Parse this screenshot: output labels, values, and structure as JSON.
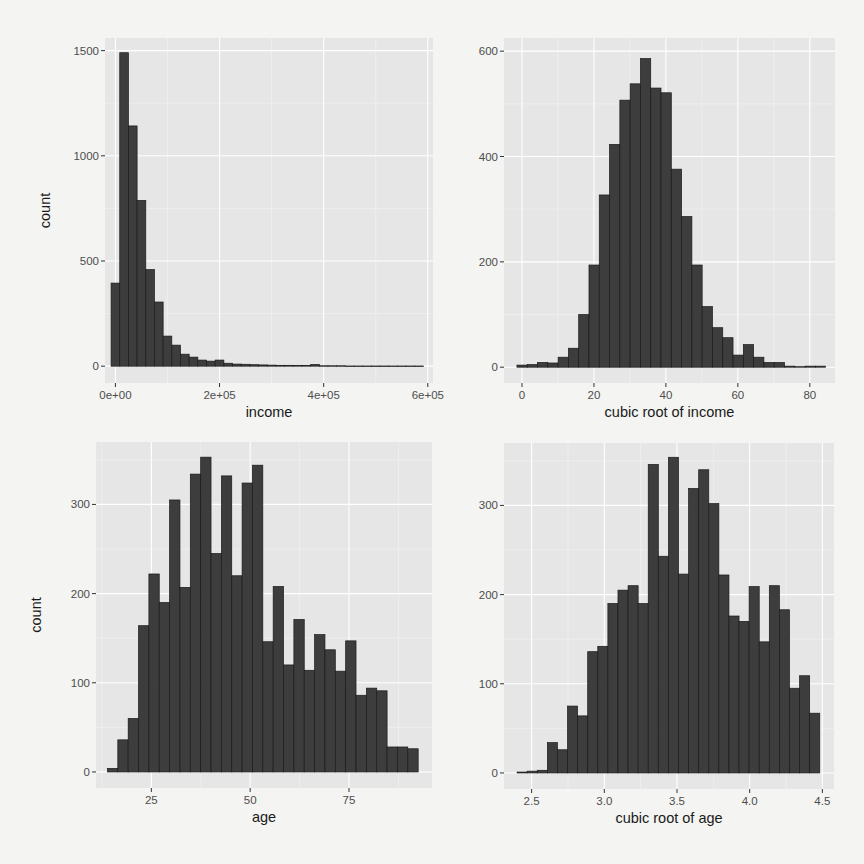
{
  "chart_data": [
    {
      "id": "income",
      "type": "bar",
      "subtype": "histogram",
      "title": "",
      "xlabel": "income",
      "ylabel": "count",
      "xlim": [
        -20000,
        610000
      ],
      "ylim": [
        -80,
        1560
      ],
      "x_ticks": [
        0,
        200000,
        400000,
        600000
      ],
      "x_tick_labels": [
        "0e+00",
        "2e+05",
        "4e+05",
        "6e+05"
      ],
      "y_ticks": [
        0,
        500,
        1000,
        1500
      ],
      "y_tick_labels": [
        "0",
        "500",
        "1000",
        "1500"
      ],
      "bin_start": -8333,
      "bin_width": 16667,
      "values": [
        395,
        1490,
        1142,
        788,
        459,
        305,
        143,
        100,
        57,
        43,
        29,
        24,
        29,
        14,
        10,
        9,
        7,
        6,
        5,
        4,
        4,
        3,
        3,
        8,
        2,
        2,
        2,
        1,
        1,
        1,
        1,
        1,
        1,
        1,
        1,
        1
      ],
      "grid": true
    },
    {
      "id": "cubic-root-income",
      "type": "bar",
      "subtype": "histogram",
      "title": "",
      "xlabel": "cubic root of income",
      "ylabel": "",
      "xlim": [
        -5,
        87
      ],
      "ylim": [
        -30,
        625
      ],
      "x_ticks": [
        0,
        20,
        40,
        60,
        80
      ],
      "x_tick_labels": [
        "0",
        "20",
        "40",
        "60",
        "80"
      ],
      "y_ticks": [
        0,
        200,
        400,
        600
      ],
      "y_tick_labels": [
        "0",
        "200",
        "400",
        "600"
      ],
      "bin_start": -1.4,
      "bin_width": 2.86,
      "values": [
        4,
        5,
        9,
        8,
        19,
        36,
        100,
        194,
        327,
        423,
        507,
        538,
        586,
        530,
        521,
        376,
        286,
        194,
        115,
        75,
        56,
        23,
        43,
        19,
        9,
        9,
        2,
        1,
        2,
        2
      ],
      "grid": true
    },
    {
      "id": "age",
      "type": "bar",
      "subtype": "histogram",
      "title": "",
      "xlabel": "age",
      "ylabel": "count",
      "xlim": [
        11,
        96
      ],
      "ylim": [
        -18,
        370
      ],
      "x_ticks": [
        25,
        50,
        75
      ],
      "x_tick_labels": [
        "25",
        "50",
        "75"
      ],
      "y_ticks": [
        0,
        100,
        200,
        300
      ],
      "y_tick_labels": [
        "0",
        "100",
        "200",
        "300"
      ],
      "bin_start": 13.9,
      "bin_width": 2.62,
      "values": [
        4,
        36,
        60,
        164,
        222,
        190,
        305,
        207,
        334,
        353,
        245,
        332,
        220,
        324,
        344,
        146,
        208,
        120,
        171,
        114,
        154,
        137,
        113,
        147,
        86,
        94,
        91,
        28,
        28,
        26
      ],
      "grid": true
    },
    {
      "id": "cubic-root-age",
      "type": "bar",
      "subtype": "histogram",
      "title": "",
      "xlabel": "cubic root of age",
      "ylabel": "",
      "xlim": [
        2.31,
        4.58
      ],
      "ylim": [
        -18,
        370
      ],
      "x_ticks": [
        2.5,
        3.0,
        3.5,
        4.0,
        4.5
      ],
      "x_tick_labels": [
        "2.5",
        "3.0",
        "3.5",
        "4.0",
        "4.5"
      ],
      "y_ticks": [
        0,
        100,
        200,
        300
      ],
      "y_tick_labels": [
        "0",
        "100",
        "200",
        "300"
      ],
      "bin_start": 2.4,
      "bin_width": 0.0694,
      "values": [
        1,
        2,
        3,
        34,
        26,
        75,
        64,
        136,
        142,
        190,
        205,
        210,
        190,
        346,
        243,
        354,
        223,
        319,
        340,
        302,
        222,
        176,
        170,
        209,
        147,
        210,
        183,
        95,
        109,
        67
      ],
      "grid": true
    }
  ]
}
